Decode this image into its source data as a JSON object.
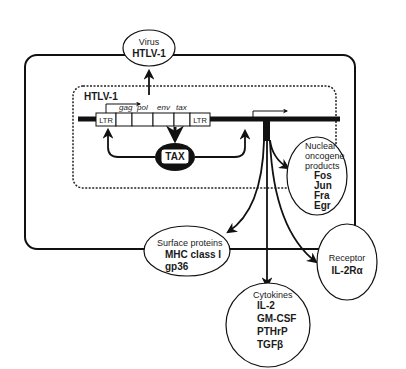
{
  "diagram": {
    "cell_boundary": "cell",
    "nucleus_boundary": "nucleus",
    "provirus": {
      "label": "HTLV-1",
      "ltr_left": "LTR",
      "ltr_right": "LTR",
      "genes": [
        "gag",
        "pol",
        "env",
        "tax"
      ]
    },
    "tax_protein": "TAX",
    "virus": {
      "line1": "Virus",
      "line2": "HTLV-1"
    },
    "nuclear_oncogenes": {
      "line1": "Nuclear",
      "line2": "oncogene",
      "line3": "products",
      "items": [
        "Fos",
        "Jun",
        "Fra",
        "Egr"
      ]
    },
    "surface_proteins": {
      "title": "Surface proteins",
      "items": [
        "MHC class I",
        "gp36"
      ]
    },
    "cytokines": {
      "title": "Cytokines",
      "items": [
        "IL-2",
        "GM-CSF",
        "PTHrP",
        "TGFβ"
      ]
    },
    "receptor": {
      "title": "Receptor",
      "items": [
        "IL-2Rα"
      ]
    }
  }
}
